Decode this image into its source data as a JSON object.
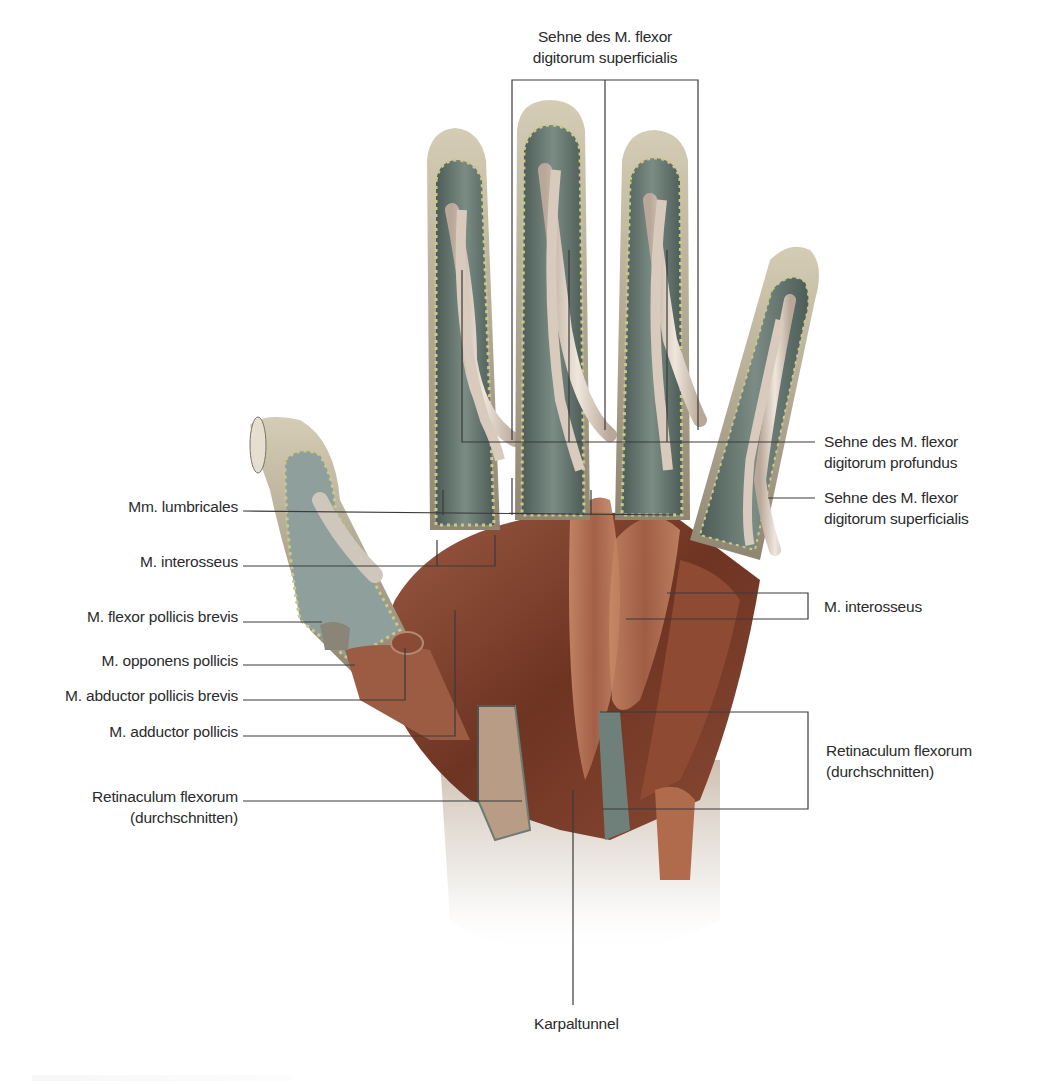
{
  "figure": {
    "colors": {
      "background": "#ffffff",
      "leader_line": "#3a3a3a",
      "tendon_sheath": "#5f7068",
      "tendon": "#d9cdbf",
      "muscle": "#7a3f2a",
      "muscle_light": "#b57a5c",
      "skin_edge": "#a59c86",
      "fat_dots": "#c9c98a",
      "wrist_fade": "#ececec"
    }
  },
  "labels": {
    "top": {
      "sehne_fds_top": [
        "Sehne des M. flexor",
        "digitorum superficialis"
      ]
    },
    "left": {
      "mm_lumbricales": "Mm. lumbricales",
      "m_interosseus_left": "M. interosseus",
      "m_flexor_pollicis_brevis": "M. flexor pollicis brevis",
      "m_opponens_pollicis": "M. opponens pollicis",
      "m_abductor_pollicis_brevis": "M. abductor pollicis brevis",
      "m_adductor_pollicis": "M. adductor pollicis",
      "retinaculum_left": [
        "Retinaculum flexorum",
        "(durchschnitten)"
      ]
    },
    "right": {
      "sehne_fdp": [
        "Sehne des M. flexor",
        "digitorum profundus"
      ],
      "sehne_fds_right": [
        "Sehne des M. flexor",
        "digitorum superficialis"
      ],
      "m_interosseus_right": "M. interosseus",
      "retinaculum_right": [
        "Retinaculum flexorum",
        "(durchschnitten)"
      ]
    },
    "bottom": {
      "karpaltunnel": "Karpaltunnel"
    }
  }
}
